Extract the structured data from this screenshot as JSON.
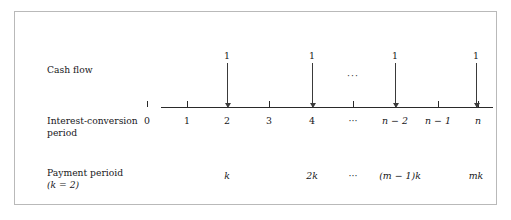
{
  "figure": {
    "type": "cash-flow-timeline",
    "border_color": "#b9b9b9",
    "background_color": "#ffffff",
    "axis_color": "#2a2a2a"
  },
  "rows": {
    "cash_flow": {
      "label": "Cash flow"
    },
    "interest_conversion": {
      "label_line1": "Interest-conversion",
      "label_line2": "period"
    },
    "payment": {
      "label_line1": "Payment perioid",
      "label_line2": "(k = 2)",
      "k_symbol": "k",
      "k_value": "2"
    }
  },
  "chart_data": {
    "type": "line",
    "title": "",
    "xlabel": "Interest-conversion period",
    "ylabel": "Cash flow",
    "grid": false,
    "legend": "none",
    "axis": {
      "start_x": 146,
      "end_x": 478,
      "y": 95
    },
    "tick_labels": [
      "0",
      "1",
      "2",
      "3",
      "4",
      "···",
      "n − 2",
      "n − 1",
      "n"
    ],
    "tick_positions": [
      146,
      186,
      226,
      268,
      311,
      352,
      394,
      437,
      477
    ],
    "tick_is_math": [
      false,
      false,
      false,
      false,
      false,
      false,
      true,
      true,
      true
    ],
    "cash_flows": [
      {
        "label": "1",
        "x": 226,
        "period": "2"
      },
      {
        "label": "1",
        "x": 311,
        "period": "4"
      },
      {
        "label": "1",
        "x": 394,
        "period": "n − 2"
      },
      {
        "label": "1",
        "x": 475,
        "period": "n"
      }
    ],
    "cash_flow_ellipsis": {
      "text": "···",
      "x": 352
    },
    "payment_labels": [
      {
        "text": "k",
        "x": 226,
        "math": true
      },
      {
        "text": "2k",
        "x": 311,
        "math": true
      },
      {
        "text": "···",
        "x": 352,
        "math": false
      },
      {
        "text": "(m − 1)k",
        "x": 399,
        "math": true
      },
      {
        "text": "mk",
        "x": 475,
        "math": true
      }
    ]
  }
}
